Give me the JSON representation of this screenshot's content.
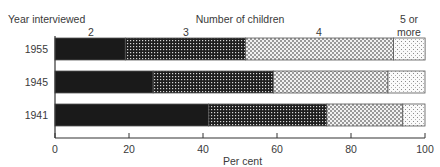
{
  "chart_data": {
    "type": "bar",
    "orientation": "horizontal",
    "stacked": true,
    "title": "",
    "legend_title": "Number of children",
    "row_axis_title": "Year interviewed",
    "xlabel": "Per cent",
    "ylabel": "Year interviewed",
    "xlim": [
      0,
      100
    ],
    "xticks": [
      0,
      20,
      40,
      60,
      80,
      100
    ],
    "grid": false,
    "legend_position": "top (inline column labels above the 1955 bar)",
    "categories": [
      "1955",
      "1945",
      "1941"
    ],
    "series": [
      {
        "name": "2",
        "pattern": "solid-black",
        "values": [
          19,
          26.5,
          41.5
        ]
      },
      {
        "name": "3",
        "pattern": "dense-grid",
        "values": [
          32.5,
          32.5,
          32
        ]
      },
      {
        "name": "4",
        "pattern": "crosshatch-light",
        "values": [
          40,
          31,
          20.5
        ]
      },
      {
        "name": "5 or more",
        "pattern": "sparse-dots",
        "values": [
          8.5,
          10,
          6
        ]
      }
    ]
  },
  "labels": {
    "row_axis_title": "Year interviewed",
    "legend_title": "Number of children",
    "series": [
      "2",
      "3",
      "4"
    ],
    "series_last_line1": "5 or",
    "series_last_line2": "more",
    "years": [
      "1955",
      "1945",
      "1941"
    ],
    "ticks": [
      "0",
      "20",
      "40",
      "60",
      "80",
      "100"
    ],
    "xlabel": "Per cent"
  },
  "colors": {
    "ink": "#1a1a1a",
    "text": "#3a3a3a",
    "background": "#ffffff"
  }
}
